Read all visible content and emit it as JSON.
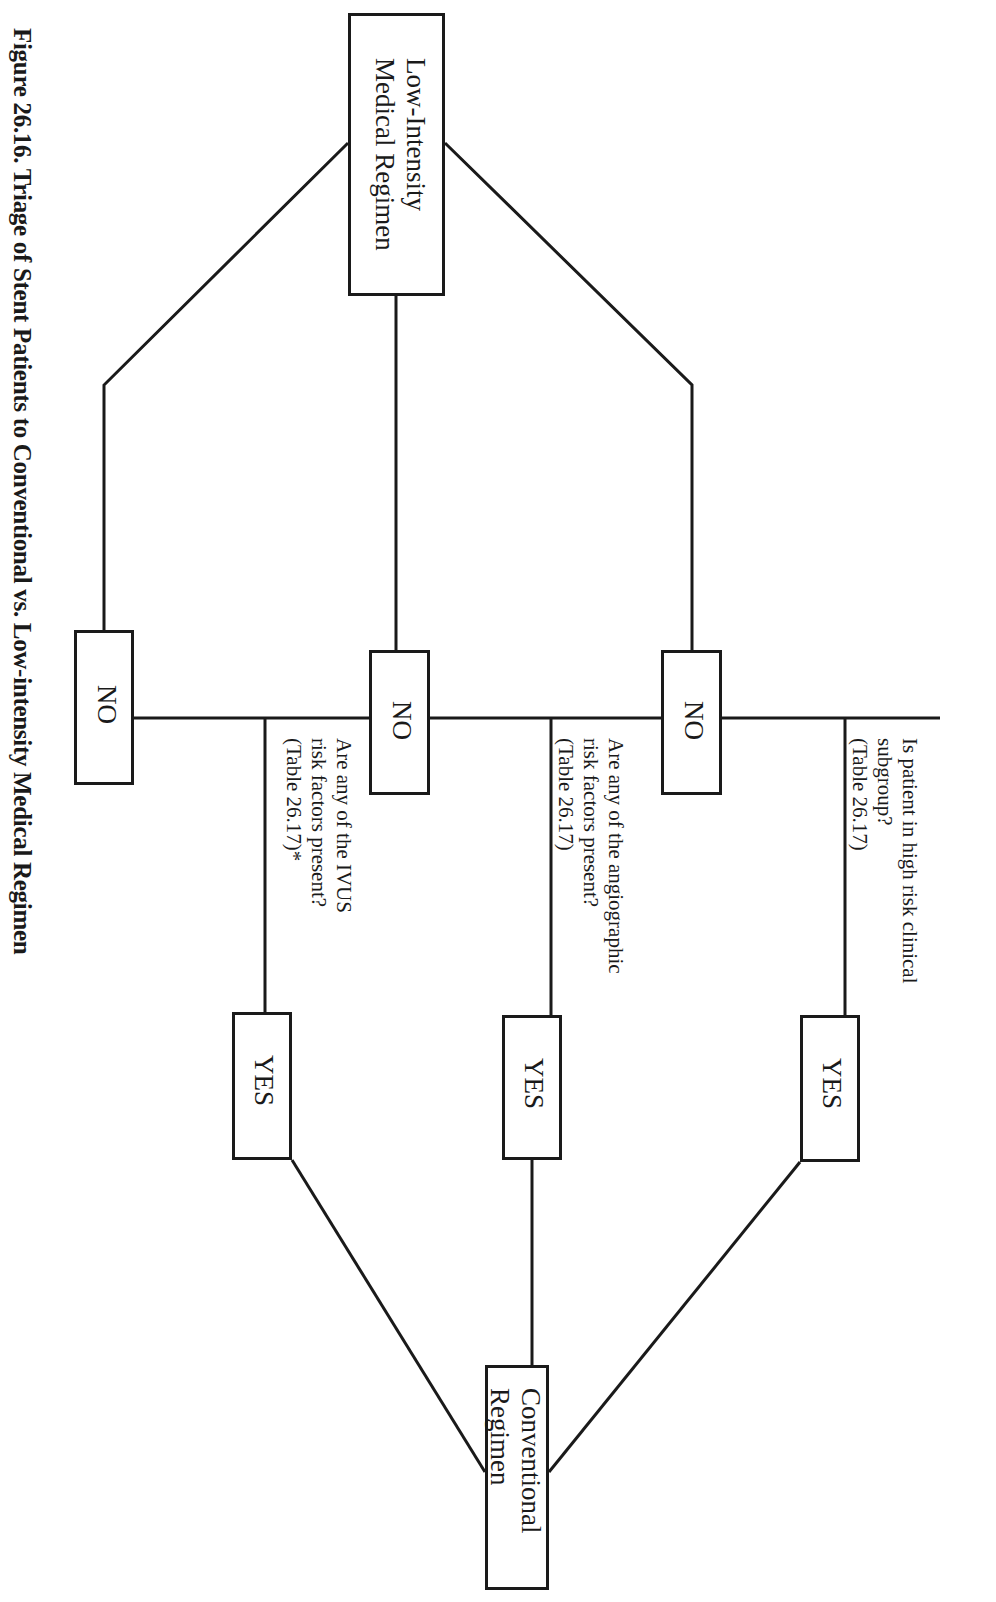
{
  "figure": {
    "caption": "Figure 26.16.  Triage of Stent Patients to Conventional vs. Low-intensity Medical Regimen"
  },
  "nodes": {
    "low_intensity": {
      "line1": "Low-Intensity",
      "line2": "Medical Regimen"
    },
    "conventional": {
      "line1": "Conventional",
      "line2": "Regimen"
    },
    "no_label": "NO",
    "yes_label": "YES"
  },
  "questions": [
    {
      "line1": "Is patient in high risk clinical",
      "line2": "subgroup?",
      "line3": "(Table 26.17)"
    },
    {
      "line1": "Are  any of the angiographic",
      "line2": "risk factors present?",
      "line3": "(Table 26.17)"
    },
    {
      "line1": "Are any of the IVUS",
      "line2": "risk factors present?",
      "line3": "(Table 26.17)*"
    }
  ],
  "colors": {
    "line": "#1a1a1a",
    "background": "#ffffff"
  }
}
